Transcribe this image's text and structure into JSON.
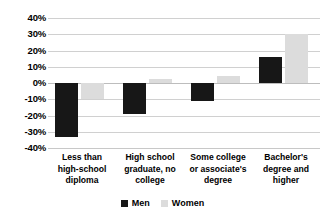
{
  "chart_data": {
    "type": "bar",
    "title": "",
    "subtitle": "",
    "xlabel": "",
    "ylabel": "",
    "ylim": [
      -40,
      40
    ],
    "ytick_step": 10,
    "ytick_labels": [
      "40%",
      "30%",
      "20%",
      "10%",
      "0%",
      "-10%",
      "-20%",
      "-30%",
      "-40%"
    ],
    "ytick_values": [
      40,
      30,
      20,
      10,
      0,
      -10,
      -20,
      -30,
      -40
    ],
    "grid": true,
    "legend_position": "bottom",
    "categories": [
      "Less than high-school diploma",
      "High school graduate, no college",
      "Some college or associate's degree",
      "Bachelor's degree and higher"
    ],
    "category_lines": [
      [
        "Less than",
        "high-school",
        "diploma"
      ],
      [
        "High school",
        "graduate, no",
        "college"
      ],
      [
        "Some college",
        "or associate's",
        "degree"
      ],
      [
        "Bachelor's",
        "degree and",
        "higher"
      ]
    ],
    "series": [
      {
        "name": "Men",
        "color": "#171717",
        "values": [
          -33,
          -19,
          -11,
          16
        ]
      },
      {
        "name": "Women",
        "color": "#dcdcdc",
        "values": [
          -10,
          2.5,
          4.5,
          30
        ]
      }
    ]
  },
  "legend": {
    "items": [
      {
        "label": "Men",
        "swatch": "men-swatch-icon"
      },
      {
        "label": "Women",
        "swatch": "women-swatch-icon"
      }
    ]
  }
}
